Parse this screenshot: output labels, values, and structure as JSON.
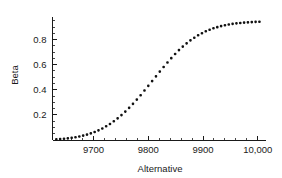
{
  "chart_data": {
    "type": "scatter",
    "title": "",
    "xlabel": "Alternative",
    "ylabel": "Beta",
    "xlim": [
      9625,
      10015
    ],
    "ylim": [
      0.0,
      0.98
    ],
    "grid": false,
    "legend": null,
    "xticks": [
      9700,
      9800,
      9900,
      10000
    ],
    "xtick_labels": [
      "9700",
      "9800",
      "9900",
      "10,000"
    ],
    "yticks": [
      0.2,
      0.4,
      0.6,
      0.8
    ],
    "ytick_labels": [
      "0.2",
      "0.4",
      "0.6",
      "0.8"
    ],
    "x_minor_tick_step": 20,
    "y_minor_tick_step": 0.05,
    "marker": "filled-square-dot",
    "marker_color": "#111111",
    "marker_size_px": 2.6,
    "series": [
      {
        "name": "Beta",
        "x": [
          9632,
          9639,
          9646,
          9653,
          9660,
          9667,
          9674,
          9681,
          9688,
          9695,
          9702,
          9709,
          9716,
          9723,
          9730,
          9737,
          9744,
          9751,
          9758,
          9765,
          9772,
          9779,
          9786,
          9793,
          9800,
          9807,
          9814,
          9821,
          9828,
          9835,
          9842,
          9849,
          9856,
          9863,
          9870,
          9877,
          9884,
          9891,
          9898,
          9905,
          9912,
          9919,
          9926,
          9933,
          9940,
          9947,
          9954,
          9961,
          9968,
          9975,
          9982,
          9989,
          9996,
          10003
        ],
        "y": [
          0.005,
          0.007,
          0.01,
          0.013,
          0.017,
          0.022,
          0.028,
          0.035,
          0.043,
          0.053,
          0.064,
          0.077,
          0.092,
          0.109,
          0.128,
          0.149,
          0.172,
          0.198,
          0.226,
          0.256,
          0.288,
          0.322,
          0.357,
          0.394,
          0.431,
          0.469,
          0.507,
          0.545,
          0.582,
          0.618,
          0.652,
          0.685,
          0.716,
          0.744,
          0.77,
          0.794,
          0.815,
          0.834,
          0.851,
          0.866,
          0.879,
          0.89,
          0.899,
          0.907,
          0.914,
          0.92,
          0.925,
          0.929,
          0.932,
          0.935,
          0.937,
          0.939,
          0.941,
          0.942
        ]
      }
    ]
  },
  "axes": {
    "x_title": "Alternative",
    "y_title": "Beta"
  }
}
